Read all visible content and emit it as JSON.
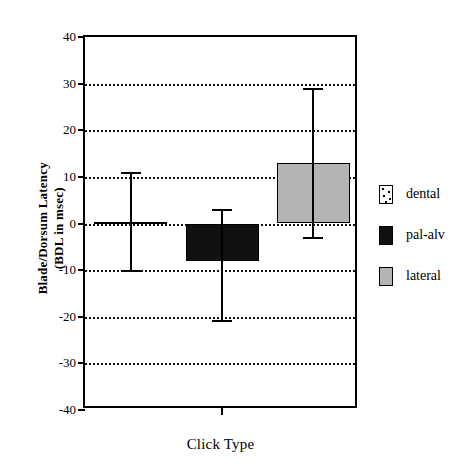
{
  "chart_data": {
    "type": "bar",
    "title": "",
    "xlabel": "Click Type",
    "ylabel": "Blade/Dorsum Latency\n(BDL in msec)",
    "categories": [
      "dental",
      "pal-alv",
      "lateral"
    ],
    "values": [
      0.4,
      -8.0,
      13.0
    ],
    "errors_low": [
      -10.0,
      -20.8,
      -2.8
    ],
    "errors_high": [
      11.0,
      3.2,
      29.0
    ],
    "ylim": [
      -40,
      40
    ],
    "ytick_labels": [
      "40",
      "30",
      "20",
      "10",
      "0",
      "-10",
      "-20",
      "-30",
      "-40"
    ],
    "ytick_values": [
      40,
      30,
      20,
      10,
      0,
      -10,
      -20,
      -30,
      -40
    ],
    "xtick_labels": [
      ""
    ],
    "grid": "horizontal-dotted",
    "legend_position": "right",
    "series": [
      {
        "name": "dental",
        "value": 0.4,
        "err_low": -10.0,
        "err_high": 11.0,
        "fill": "stipple",
        "color": "#ffffff"
      },
      {
        "name": "pal-alv",
        "value": -8.0,
        "err_low": -20.8,
        "err_high": 3.2,
        "fill": "black",
        "color": "#111111"
      },
      {
        "name": "lateral",
        "value": 13.0,
        "err_low": -2.8,
        "err_high": 29.0,
        "fill": "gray",
        "color": "#b4b4b4"
      }
    ]
  },
  "legend": {
    "items": [
      {
        "label": "dental",
        "fill": "stipple"
      },
      {
        "label": "pal-alv",
        "fill": "black"
      },
      {
        "label": "lateral",
        "fill": "gray"
      }
    ]
  },
  "axes": {
    "y_title": "Blade/Dorsum Latency\n(BDL in msec)",
    "x_title": "Click Type"
  }
}
